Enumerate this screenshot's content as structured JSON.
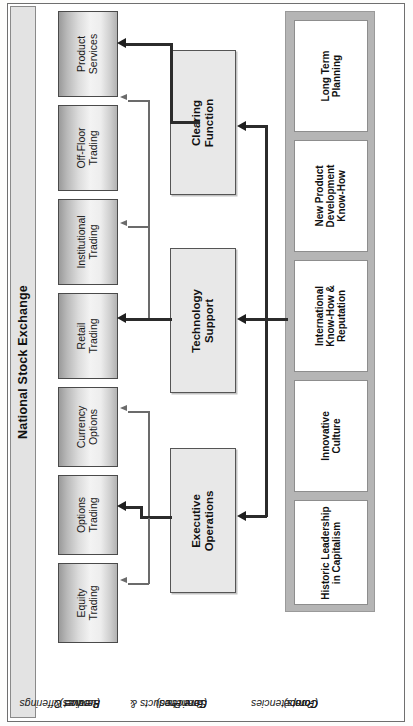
{
  "figure": {
    "title": "National Stock Exchange",
    "orientation": "rotated-90-ccw"
  },
  "tiers": [
    {
      "id": "leaves",
      "caption_line1": "Product &",
      "caption_line2": "Service Offerings",
      "caption_line3": "(Leaves)",
      "items": [
        {
          "line1": "Product",
          "line2": "Services"
        },
        {
          "line1": "Off-Floor",
          "line2": "Trading"
        },
        {
          "line1": "Institutional",
          "line2": "Trading"
        },
        {
          "line1": "Retail",
          "line2": "Trading"
        },
        {
          "line1": "Currency",
          "line2": "Options"
        },
        {
          "line1": "Options",
          "line2": "Trading"
        },
        {
          "line1": "Equity",
          "line2": "Trading"
        }
      ]
    },
    {
      "id": "branches",
      "caption_line1": "Core Products &",
      "caption_line2": "Services",
      "caption_line3": "(Branches)",
      "items": [
        {
          "line1": "Clearing",
          "line2": "Function"
        },
        {
          "line1": "Technology",
          "line2": "Support"
        },
        {
          "line1": "Executive",
          "line2": "Operations"
        }
      ]
    },
    {
      "id": "roots",
      "caption_line1": "Core",
      "caption_line2": "Competencies",
      "caption_line3": "(Roots)",
      "items": [
        {
          "line1": "Long Term",
          "line2": "Planning",
          "line3": ""
        },
        {
          "line1": "New Product",
          "line2": "Development",
          "line3": "Know-How"
        },
        {
          "line1": "International",
          "line2": "Know-How &",
          "line3": "Reputation"
        },
        {
          "line1": "Innovative",
          "line2": "Culture",
          "line3": ""
        },
        {
          "line1": "Historic Leadership",
          "line2": "in Capitalism",
          "line3": ""
        }
      ]
    }
  ],
  "colors": {
    "leaf_border": "#4a4a4a",
    "branch_fill": "#e8e8e8",
    "roots_frame": "#b5b5b5",
    "title_band": "#e3e3e3",
    "line": "#2b2b2b"
  }
}
